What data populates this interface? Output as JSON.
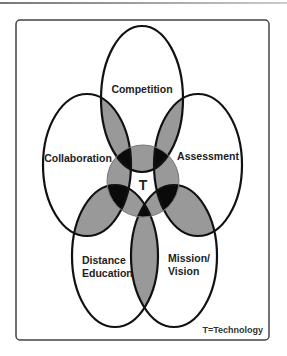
{
  "diagram": {
    "type": "overlapping-ellipses",
    "center": {
      "label": "T"
    },
    "sets": [
      {
        "id": "competition",
        "label": "Competition"
      },
      {
        "id": "collaboration",
        "label": "Collaboration"
      },
      {
        "id": "assessment",
        "label": "Assessment"
      },
      {
        "id": "distance",
        "label_lines": [
          "Distance",
          "Education"
        ]
      },
      {
        "id": "mission",
        "label_lines": [
          "Mission/",
          "Vision"
        ]
      }
    ],
    "legend": "T=Technology",
    "colors": {
      "outline": "#111111",
      "overlap": "#999999",
      "triple_overlap": "#0a0a0a",
      "background": "#ffffff"
    }
  }
}
